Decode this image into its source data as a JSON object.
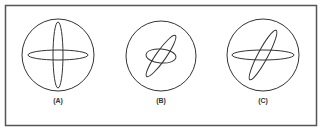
{
  "figure": {
    "panels": [
      {
        "label": "(A)",
        "circle": {
          "cx": 58,
          "cy": 55,
          "r": 36
        },
        "ellipses": [
          {
            "rx": 30,
            "ry": 5,
            "angle": 0
          },
          {
            "rx": 5,
            "ry": 33,
            "angle": 0
          }
        ]
      },
      {
        "label": "(B)",
        "circle": {
          "cx": 161,
          "cy": 56,
          "r": 35
        },
        "ellipses": [
          {
            "rx": 15,
            "ry": 7,
            "angle": 5
          },
          {
            "rx": 25,
            "ry": 5,
            "angle": -55
          }
        ]
      },
      {
        "label": "(C)",
        "circle": {
          "cx": 263,
          "cy": 55,
          "r": 36
        },
        "ellipses": [
          {
            "rx": 31,
            "ry": 5,
            "angle": 0
          },
          {
            "rx": 28,
            "ry": 5,
            "angle": -62
          }
        ]
      }
    ],
    "colors": {
      "stroke": "#333333",
      "frame": "#555555"
    }
  }
}
